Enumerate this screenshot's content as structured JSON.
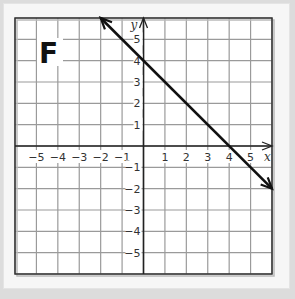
{
  "panel": {
    "label": "F"
  },
  "chart_data": {
    "type": "line",
    "title": "F",
    "xlabel": "x",
    "ylabel": "y",
    "xlim": [
      -6,
      6
    ],
    "ylim": [
      -6,
      6
    ],
    "grid": true,
    "x_ticks": [
      "-5",
      "-4",
      "-3",
      "-2",
      "-1",
      "1",
      "2",
      "3",
      "4",
      "5"
    ],
    "y_ticks": [
      "5",
      "4",
      "3",
      "2",
      "1",
      "-1",
      "-2",
      "-3",
      "-4",
      "-5"
    ],
    "series": [
      {
        "name": "y = -x + 4",
        "slope": -1,
        "intercept": 4,
        "x": [
          -2,
          6
        ],
        "y": [
          6,
          -2
        ],
        "arrows": "both"
      }
    ],
    "key_points": [
      {
        "x": 0,
        "y": 4
      },
      {
        "x": 4,
        "y": 0
      }
    ]
  },
  "colors": {
    "grid": "#9a9a9a",
    "axis": "#222222",
    "line": "#111111",
    "panel": "#f6f6f6",
    "background": "#dcdcdc"
  }
}
